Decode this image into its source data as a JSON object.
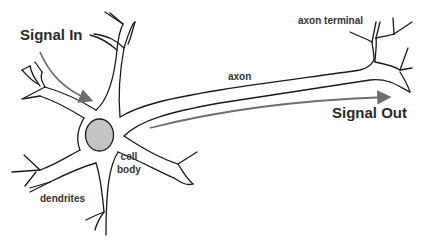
{
  "diagram": {
    "labels": {
      "signal_in": "Signal In",
      "signal_out": "Signal Out",
      "axon": "axon",
      "axon_terminal": "axon terminal",
      "cell_body_line1": "cell",
      "cell_body_line2": "body",
      "dendrites": "dendrites"
    },
    "colors": {
      "outline": "#1a1a1a",
      "nucleus_fill": "#c4c4c4",
      "arrow": "#6e6e6e",
      "text": "#2a2a2a"
    },
    "parts": [
      "dendrites",
      "cell body",
      "nucleus",
      "axon",
      "axon terminal"
    ],
    "arrows": [
      {
        "name": "signal-in-arrow",
        "from": "Signal In label",
        "to": "cell body"
      },
      {
        "name": "signal-out-arrow",
        "from": "cell body",
        "to": "Signal Out label"
      }
    ]
  }
}
